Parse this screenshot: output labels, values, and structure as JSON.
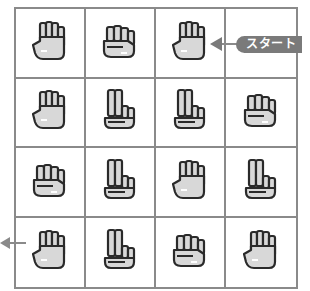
{
  "diagram": {
    "type": "rock-paper-scissors maze grid",
    "rows": 4,
    "cols": 4,
    "grid": [
      [
        "paper",
        "rock",
        "paper",
        ""
      ],
      [
        "paper",
        "scissors",
        "scissors",
        "rock"
      ],
      [
        "rock",
        "scissors",
        "paper",
        "scissors"
      ],
      [
        "paper",
        "scissors",
        "rock",
        "paper"
      ]
    ],
    "start": {
      "label": "スタート",
      "row": 0,
      "col": 2,
      "direction": "left"
    },
    "exit": {
      "row": 3,
      "col": 0,
      "direction": "left"
    }
  },
  "colors": {
    "grid_line": "#8a8a8a",
    "label_bg": "#7a7a7a",
    "label_text": "#ffffff",
    "hand_fill": "#d8d8d8",
    "hand_outline": "#2a2a2a"
  }
}
